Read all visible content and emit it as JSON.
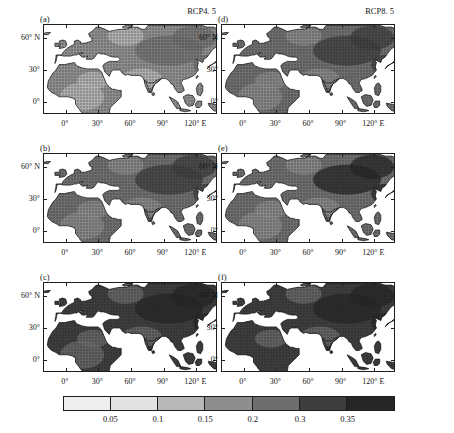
{
  "figure": {
    "columns": [
      {
        "id": "left",
        "scenario": "RCP4. 5"
      },
      {
        "id": "right",
        "scenario": "RCP8. 5"
      }
    ],
    "panels": [
      {
        "tag": "(a)",
        "column": "left",
        "row": 0,
        "scenario": "RCP4. 5"
      },
      {
        "tag": "(b)",
        "column": "left",
        "row": 1,
        "scenario": "RCP4. 5"
      },
      {
        "tag": "(c)",
        "column": "left",
        "row": 2,
        "scenario": "RCP4. 5"
      },
      {
        "tag": "(d)",
        "column": "right",
        "row": 0,
        "scenario": "RCP8. 5"
      },
      {
        "tag": "(e)",
        "column": "right",
        "row": 1,
        "scenario": "RCP8. 5"
      },
      {
        "tag": "(f)",
        "column": "right",
        "row": 2,
        "scenario": "RCP8. 5"
      }
    ],
    "axes": {
      "x_ticks": [
        "0°",
        "30°",
        "60°",
        "90°",
        "120° E"
      ],
      "y_ticks": [
        "60° N",
        "30°",
        "0°"
      ]
    }
  },
  "chart_data": {
    "type": "heatmap",
    "title": "",
    "xlabel": "",
    "ylabel": "",
    "xlim": [
      -20,
      140
    ],
    "ylim": [
      -12,
      72
    ],
    "grid": false,
    "legend_position": "bottom",
    "x_tick_values": [
      0,
      30,
      60,
      90,
      120
    ],
    "x_tick_labels": [
      "0°",
      "30°",
      "60°",
      "90°",
      "120° E"
    ],
    "y_tick_values": [
      0,
      30,
      60
    ],
    "y_tick_labels": [
      "0°",
      "30°",
      "60° N"
    ],
    "colorbar": {
      "tick_labels": [
        "0.05",
        "0.1",
        "0.15",
        "0.2",
        "0.3",
        "0.35"
      ],
      "tick_values": [
        0.05,
        0.1,
        0.15,
        0.2,
        0.3,
        0.35
      ],
      "segment_colors": [
        "#eeeeee",
        "#e2e2e2",
        "#b8b8b8",
        "#8e8e8e",
        "#6e6e6e",
        "#3d3d3d",
        "#262626"
      ],
      "segment_count": 7
    },
    "panels": [
      {
        "tag": "(a)",
        "scenario": "RCP4. 5",
        "mean_level": 0.18,
        "stippled": true
      },
      {
        "tag": "(b)",
        "scenario": "RCP4. 5",
        "mean_level": 0.22,
        "stippled": true
      },
      {
        "tag": "(c)",
        "scenario": "RCP4. 5",
        "mean_level": 0.27,
        "stippled": true
      },
      {
        "tag": "(d)",
        "scenario": "RCP8. 5",
        "mean_level": 0.2,
        "stippled": true
      },
      {
        "tag": "(e)",
        "scenario": "RCP8. 5",
        "mean_level": 0.25,
        "stippled": true
      },
      {
        "tag": "(f)",
        "scenario": "RCP8. 5",
        "mean_level": 0.3,
        "stippled": true
      }
    ]
  }
}
